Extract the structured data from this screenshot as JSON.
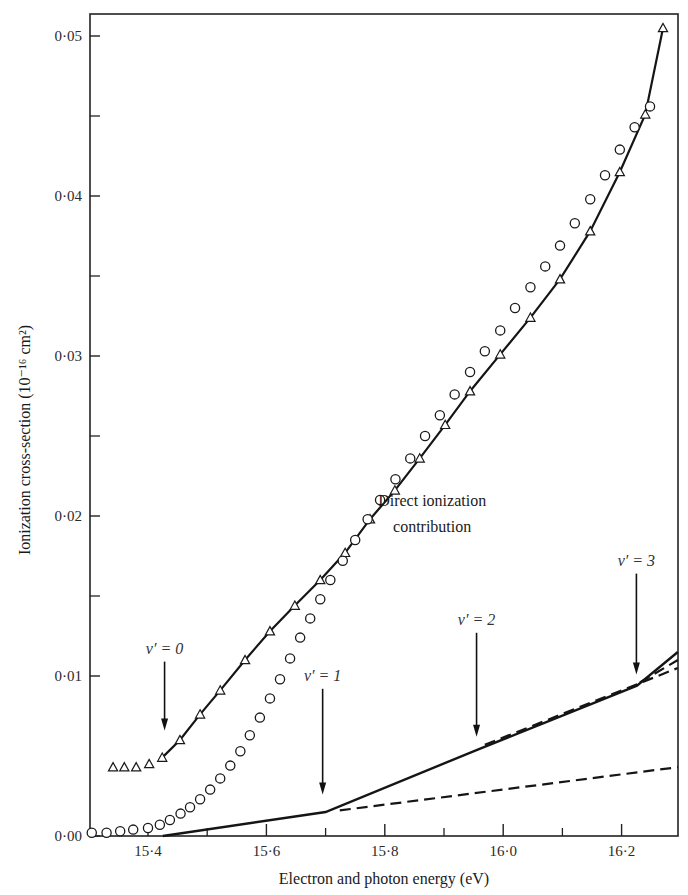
{
  "chart_data": {
    "type": "scatter",
    "title": "",
    "xlabel": "Electron and photon energy (eV)",
    "ylabel": "Ionization cross-section (10⁻¹⁶ cm²)",
    "xlim": [
      15.3,
      16.295
    ],
    "ylim": [
      0.0,
      0.0524
    ],
    "x_ticks": [
      15.4,
      15.6,
      15.8,
      16.0,
      16.2
    ],
    "x_tick_labels": [
      "15·4",
      "15·6",
      "15·8",
      "16·0",
      "16·2"
    ],
    "x_minor_ticks": [
      15.5,
      15.7,
      15.9,
      16.1
    ],
    "y_ticks": [
      0.0,
      0.01,
      0.02,
      0.03,
      0.04,
      0.05
    ],
    "y_tick_labels": [
      "0·00",
      "0·01",
      "0·02",
      "0·03",
      "0·04",
      "0·05"
    ],
    "y_minor_ticks": [
      0.015,
      0.025,
      0.035,
      0.045
    ],
    "grid": false,
    "legend": null,
    "series": [
      {
        "name": "triangles (photon)",
        "marker": "triangle",
        "line": true,
        "line_start_index": 4,
        "x": [
          15.341,
          15.36,
          15.38,
          15.402,
          15.424,
          15.454,
          15.488,
          15.522,
          15.564,
          15.606,
          15.648,
          15.691,
          15.733,
          15.775,
          15.817,
          15.859,
          15.902,
          15.944,
          15.995,
          16.046,
          16.096,
          16.147,
          16.197,
          16.24,
          16.27
        ],
        "y": [
          0.0043,
          0.0043,
          0.0043,
          0.0045,
          0.0049,
          0.006,
          0.0076,
          0.0091,
          0.011,
          0.0128,
          0.0144,
          0.016,
          0.0177,
          0.0198,
          0.0216,
          0.0236,
          0.0257,
          0.0278,
          0.0301,
          0.0324,
          0.0348,
          0.0378,
          0.0415,
          0.0451,
          0.0505
        ]
      },
      {
        "name": "circles (electron)",
        "marker": "circle",
        "line": false,
        "x": [
          15.305,
          15.33,
          15.353,
          15.375,
          15.4,
          15.42,
          15.437,
          15.455,
          15.471,
          15.488,
          15.505,
          15.522,
          15.539,
          15.556,
          15.572,
          15.589,
          15.606,
          15.623,
          15.64,
          15.657,
          15.674,
          15.691,
          15.708,
          15.729,
          15.75,
          15.771,
          15.792,
          15.818,
          15.843,
          15.868,
          15.893,
          15.918,
          15.944,
          15.969,
          15.995,
          16.02,
          16.046,
          16.071,
          16.096,
          16.121,
          16.147,
          16.172,
          16.197,
          16.222,
          16.248
        ],
        "y": [
          0.0002,
          0.0002,
          0.0003,
          0.0004,
          0.0005,
          0.0007,
          0.001,
          0.0014,
          0.0018,
          0.0023,
          0.0029,
          0.0036,
          0.0044,
          0.0053,
          0.0063,
          0.0074,
          0.0086,
          0.0098,
          0.0111,
          0.0124,
          0.0136,
          0.0148,
          0.016,
          0.0172,
          0.0185,
          0.0198,
          0.021,
          0.0223,
          0.0236,
          0.025,
          0.0263,
          0.0276,
          0.029,
          0.0303,
          0.0316,
          0.033,
          0.0343,
          0.0356,
          0.0369,
          0.0383,
          0.0398,
          0.0413,
          0.0429,
          0.0443,
          0.0456
        ]
      },
      {
        "name": "Direct ionization contribution",
        "marker": "none",
        "line": "solid",
        "x": [
          15.425,
          15.7,
          15.957,
          16.226,
          16.295
        ],
        "y": [
          0.0,
          0.0015,
          0.0054,
          0.0094,
          0.0115
        ]
      },
      {
        "name": "v'=1 extrapolation",
        "marker": "none",
        "line": "dashed",
        "x": [
          15.724,
          16.295
        ],
        "y": [
          0.0016,
          0.0043
        ]
      },
      {
        "name": "v'=2 extrapolation",
        "marker": "none",
        "line": "dashed",
        "x": [
          15.969,
          16.295
        ],
        "y": [
          0.0057,
          0.0105
        ]
      },
      {
        "name": "v'=3 extrapolation",
        "marker": "none",
        "line": "dashed",
        "x": [
          16.231,
          16.295
        ],
        "y": [
          0.0096,
          0.011
        ]
      }
    ],
    "annotations": [
      {
        "text": "v′ = 0",
        "arrow_x": 15.428,
        "arrow_tip_y": 0.0066,
        "label_y": 0.0114
      },
      {
        "text": "v′ = 1",
        "arrow_x": 15.695,
        "arrow_tip_y": 0.0026,
        "label_y": 0.0097
      },
      {
        "text": "v′ = 2",
        "arrow_x": 15.955,
        "arrow_tip_y": 0.0062,
        "label_y": 0.0132
      },
      {
        "text": "v′ = 3",
        "arrow_x": 16.225,
        "arrow_tip_y": 0.0101,
        "label_y": 0.0169
      },
      {
        "text": "Direct ionization",
        "x": 15.88,
        "y": 0.0206
      },
      {
        "text": "contribution",
        "x": 15.88,
        "y": 0.019
      }
    ]
  }
}
